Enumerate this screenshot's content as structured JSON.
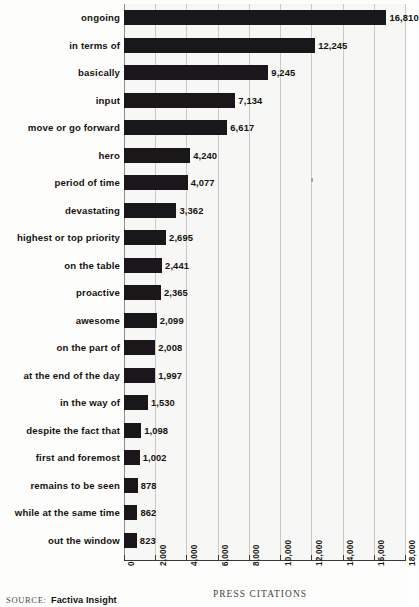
{
  "chart_data": {
    "type": "bar",
    "orientation": "horizontal",
    "title": "",
    "xlabel": "PRESS CITATIONS",
    "ylabel": "",
    "xlim": [
      0,
      18000
    ],
    "xticks": [
      0,
      2000,
      4000,
      6000,
      8000,
      10000,
      12000,
      14000,
      16000,
      18000
    ],
    "xtick_labels": [
      "0",
      "2,000",
      "4,000",
      "6,000",
      "8,000",
      "10,000",
      "12,000",
      "14,000",
      "16,000",
      "18,000"
    ],
    "grid": true,
    "legend": false,
    "bar_color": "#19171a",
    "background_color": "#f7f7f5",
    "categories": [
      "ongoing",
      "in terms of",
      "basically",
      "input",
      "move or go forward",
      "hero",
      "period of time",
      "devastating",
      "highest or top priority",
      "on the table",
      "proactive",
      "awesome",
      "on the part of",
      "at the end of the day",
      "in the way of",
      "despite the fact that",
      "first and foremost",
      "remains to be seen",
      "while at the same time",
      "out the window"
    ],
    "values": [
      16810,
      12245,
      9245,
      7134,
      6617,
      4240,
      4077,
      3362,
      2695,
      2441,
      2365,
      2099,
      2008,
      1997,
      1530,
      1098,
      1002,
      878,
      862,
      823
    ],
    "value_labels": [
      "16,810",
      "12,245",
      "9,245",
      "7,134",
      "6,617",
      "4,240",
      "4,077",
      "3,362",
      "2,695",
      "2,441",
      "2,365",
      "2,099",
      "2,008",
      "1,997",
      "1,530",
      "1,098",
      "1,002",
      "878",
      "862",
      "823"
    ]
  },
  "footer": {
    "source_label": "SOURCE:",
    "source_name": "Factiva Insight"
  }
}
